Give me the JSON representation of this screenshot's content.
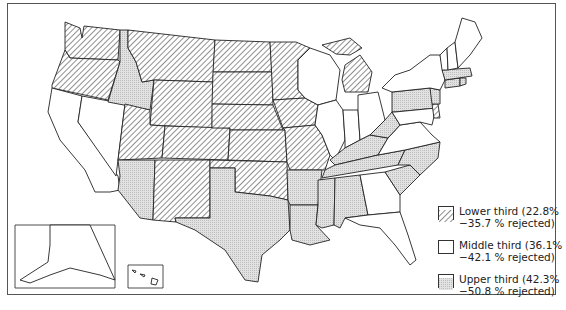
{
  "map": {
    "title": "",
    "patterns": {
      "lower": {
        "name": "hatch",
        "color": "#333333"
      },
      "middle": {
        "name": "blank",
        "color": "#ffffff"
      },
      "upper": {
        "name": "dots",
        "color": "#d6d6d6"
      }
    },
    "states": {
      "WA": "lower",
      "OR": "lower",
      "ID": "upper",
      "MT": "lower",
      "WY": "lower",
      "UT": "lower",
      "CO": "lower",
      "NV": "middle",
      "CA": "middle",
      "AZ": "upper",
      "NM": "lower",
      "ND": "lower",
      "SD": "lower",
      "NE": "lower",
      "KS": "lower",
      "OK": "lower",
      "TX": "upper",
      "MN": "lower",
      "IA": "lower",
      "MO": "lower",
      "AR": "upper",
      "LA": "upper",
      "WI": "middle",
      "IL": "middle",
      "MI": "lower",
      "IN": "middle",
      "OH": "middle",
      "KY": "upper",
      "TN": "upper",
      "MS": "upper",
      "AL": "upper",
      "GA": "middle",
      "FL": "middle",
      "SC": "upper",
      "NC": "upper",
      "VA": "middle",
      "WV": "upper",
      "PA": "upper",
      "NY": "middle",
      "NJ": "upper",
      "DE": "lower",
      "MD": "middle",
      "CT": "upper",
      "RI": "upper",
      "MA": "upper",
      "VT": "middle",
      "NH": "middle",
      "ME": "middle",
      "AK": "middle",
      "HI": "middle"
    }
  },
  "legend": {
    "items": [
      {
        "key": "lower",
        "label_line1": "Lower third (22.8%",
        "label_line2": "−35.7 % rejected)"
      },
      {
        "key": "middle",
        "label_line1": "Middle third (36.1%",
        "label_line2": "−42.1 % rejected)"
      },
      {
        "key": "upper",
        "label_line1": "Upper third (42.3%",
        "label_line2": "−50.8 % rejected)"
      }
    ]
  }
}
